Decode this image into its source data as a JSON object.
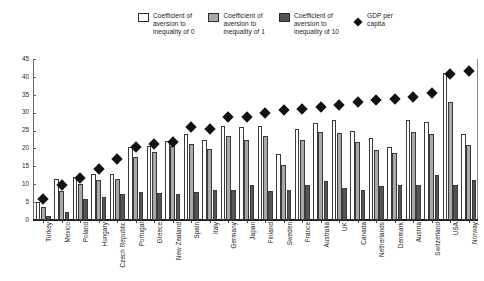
{
  "legend": {
    "items": [
      {
        "label": "Coefficient of\naversion to\ninequality of 0",
        "marker": "square-white-icon",
        "color": "#ffffff"
      },
      {
        "label": "Coefficient of\naversion to\ninequality of 1",
        "marker": "square-gray-icon",
        "color": "#a9a9a9"
      },
      {
        "label": "Coefficient of\naversion to\ninequality of 10",
        "marker": "square-darkgray-icon",
        "color": "#555555"
      },
      {
        "label": "GDP per\ncapita",
        "marker": "diamond-icon",
        "color": "#111111"
      }
    ]
  },
  "chart_data": {
    "type": "bar",
    "title": "",
    "subtitle": "",
    "xlabel": "",
    "ylabel": "",
    "ylim": [
      0,
      45
    ],
    "yticks": [
      0,
      5,
      10,
      15,
      20,
      25,
      30,
      35,
      40,
      45
    ],
    "grid": false,
    "legend_position": "top",
    "categories": [
      "Turkey",
      "Mexico",
      "Poland",
      "Hungary",
      "Czech Republic",
      "Portugal",
      "Greece",
      "New Zealand",
      "Spain",
      "Italy",
      "Germany",
      "Japan",
      "Finland",
      "Sweden",
      "France",
      "Australia",
      "UK",
      "Canada",
      "Netherlands",
      "Denmark",
      "Austria",
      "Switzerland",
      "USA",
      "Norway"
    ],
    "series": [
      {
        "name": "Coefficient of aversion to inequality of 0",
        "type": "bar",
        "color": "#ffffff",
        "values": [
          5.0,
          11.6,
          12.1,
          13.0,
          13.0,
          20.3,
          20.7,
          22.1,
          24.0,
          22.5,
          26.4,
          26.0,
          26.4,
          18.5,
          25.5,
          27.2,
          28.0,
          25.0,
          22.8,
          20.5,
          28.0,
          27.5,
          41.0,
          24.0
        ]
      },
      {
        "name": "Coefficient of aversion to inequality of 1",
        "type": "bar",
        "color": "#a9a9a9",
        "values": [
          3.6,
          8.0,
          10.0,
          11.2,
          11.5,
          17.5,
          19.0,
          20.8,
          21.3,
          19.8,
          23.6,
          22.4,
          23.5,
          15.5,
          22.5,
          24.5,
          24.4,
          21.8,
          19.5,
          18.7,
          24.6,
          24.0,
          33.0,
          21.0
        ]
      },
      {
        "name": "Coefficient of aversion to inequality of 10",
        "type": "bar",
        "color": "#555555",
        "values": [
          1.0,
          2.2,
          5.8,
          6.4,
          7.3,
          7.8,
          7.5,
          7.3,
          7.7,
          8.3,
          8.3,
          9.8,
          8.0,
          8.4,
          9.8,
          11.0,
          9.0,
          8.3,
          9.5,
          9.8,
          9.8,
          12.6,
          9.8,
          11.2
        ]
      },
      {
        "name": "GDP per capita",
        "type": "scatter",
        "marker": "diamond",
        "color": "#111111",
        "values": [
          6.9,
          11.0,
          13.0,
          15.5,
          18.3,
          21.5,
          22.5,
          22.9,
          27.0,
          26.5,
          30.0,
          30.0,
          31.0,
          31.9,
          32.2,
          32.8,
          33.3,
          34.0,
          34.8,
          35.0,
          35.5,
          36.6,
          41.8,
          42.8
        ]
      }
    ]
  }
}
